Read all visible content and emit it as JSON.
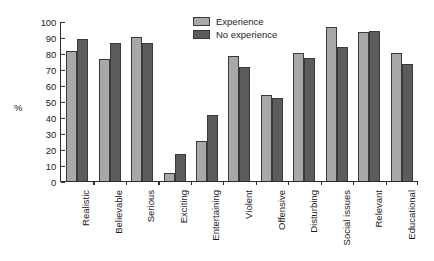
{
  "chart_data": {
    "type": "bar",
    "title": "",
    "xlabel": "",
    "ylabel": "%",
    "ylim": [
      0,
      100
    ],
    "ytick_step": 10,
    "yticks": [
      100,
      90,
      80,
      70,
      60,
      50,
      40,
      30,
      20,
      10,
      0
    ],
    "grid": false,
    "legend_position": "top-center-right",
    "categories": [
      "Realistic",
      "Believable",
      "Serious",
      "Exciting",
      "Entertaining",
      "Violent",
      "Offensive",
      "Disturbing",
      "Social issues",
      "Relevant",
      "Educational"
    ],
    "series": [
      {
        "name": "Experience",
        "color": "#a8a8a8",
        "values": [
          81,
          76,
          90,
          5,
          25,
          78,
          54,
          80,
          96,
          93,
          80
        ]
      },
      {
        "name": "No experience",
        "color": "#5c5c5c",
        "values": [
          89,
          86,
          86,
          17,
          41,
          71,
          52,
          77,
          84,
          94,
          73
        ]
      }
    ]
  },
  "legend": {
    "items": [
      {
        "label": "Experience"
      },
      {
        "label": "No experience"
      }
    ]
  }
}
